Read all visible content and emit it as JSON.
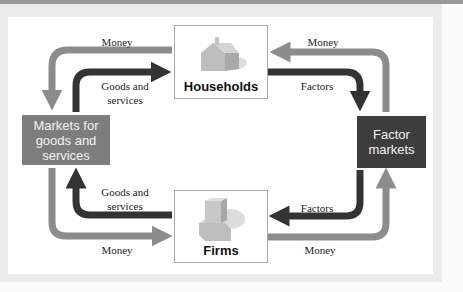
{
  "diagram": {
    "type": "circular-flow",
    "nodes": {
      "households": {
        "label": "Households",
        "icon": "house-icon"
      },
      "firms": {
        "label": "Firms",
        "icon": "factory-building-icon"
      },
      "goods_market": {
        "label_lines": [
          "Markets for",
          "goods and",
          "services"
        ],
        "color": "#7d7d7d"
      },
      "factor_market": {
        "label_lines": [
          "Factor",
          "markets"
        ],
        "color": "#3d3d3d"
      }
    },
    "flows": {
      "top_left_money": "Money",
      "top_left_goods_line1": "Goods and",
      "top_left_goods_line2": "services",
      "top_right_money": "Money",
      "top_right_factors": "Factors",
      "bottom_left_goods_line1": "Goods and",
      "bottom_left_goods_line2": "services",
      "bottom_left_money": "Money",
      "bottom_right_factors": "Factors",
      "bottom_right_money": "Money"
    },
    "colors": {
      "money_arrow": "#8c8c8c",
      "real_arrow": "#333333"
    }
  }
}
